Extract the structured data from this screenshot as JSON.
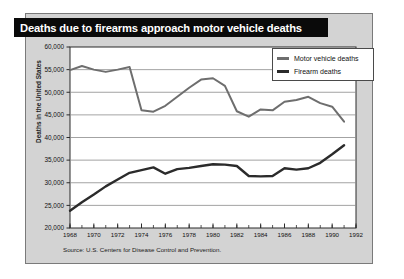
{
  "figure": {
    "title": "Deaths due to firearms approach motor vehicle deaths",
    "source_note": "Source: U.S. Centers for Disease Control and Prevention.",
    "panel_bg": "#d3d3d3",
    "plot_bg": "#ffffff",
    "title_bg": "#0a0a0a",
    "title_color": "#ffffff"
  },
  "legend": {
    "position": "top-right",
    "items": [
      {
        "label": "Motor vehicle deaths",
        "color": "#6e6e6e"
      },
      {
        "label": "Firearm deaths",
        "color": "#2b2b2b"
      }
    ]
  },
  "chart_data": {
    "type": "line",
    "title": "Deaths due to firearms approach motor vehicle deaths",
    "xlabel": "",
    "ylabel": "Deaths in the United States",
    "xlim": [
      1968,
      1992
    ],
    "ylim": [
      20000,
      60000
    ],
    "ytick_step": 5000,
    "ytick_labels": [
      "20,000",
      "25,000",
      "30,000",
      "35,000",
      "40,000",
      "45,000",
      "50,000",
      "55,000",
      "60,000"
    ],
    "ytick_values": [
      20000,
      25000,
      30000,
      35000,
      40000,
      45000,
      50000,
      55000,
      60000
    ],
    "xtick_labels": [
      "1968",
      "1970",
      "1972",
      "1974",
      "1976",
      "1978",
      "1980",
      "1982",
      "1984",
      "1986",
      "1988",
      "1990",
      "1992"
    ],
    "xtick_values": [
      1968,
      1970,
      1972,
      1974,
      1976,
      1978,
      1980,
      1982,
      1984,
      1986,
      1988,
      1990,
      1992
    ],
    "minor_xticks_every": 1,
    "grid": "horizontal",
    "x": [
      1968,
      1969,
      1970,
      1971,
      1972,
      1973,
      1974,
      1975,
      1976,
      1977,
      1978,
      1979,
      1980,
      1981,
      1982,
      1983,
      1984,
      1985,
      1986,
      1987,
      1988,
      1989,
      1990,
      1991
    ],
    "series": [
      {
        "name": "Motor vehicle deaths",
        "color": "#6e6e6e",
        "values": [
          54900,
          55800,
          55000,
          54500,
          55000,
          55600,
          46000,
          45700,
          47000,
          49000,
          51000,
          52800,
          53100,
          51400,
          45800,
          44600,
          46200,
          46000,
          47900,
          48300,
          49000,
          47600,
          46800,
          43500
        ]
      },
      {
        "name": "Firearm deaths",
        "color": "#2b2b2b",
        "values": [
          23800,
          25700,
          27400,
          29200,
          30700,
          32200,
          32800,
          33400,
          32000,
          33000,
          33300,
          33700,
          34100,
          34000,
          33700,
          31500,
          31400,
          31500,
          33200,
          32900,
          33200,
          34400,
          36300,
          38300
        ]
      }
    ]
  }
}
